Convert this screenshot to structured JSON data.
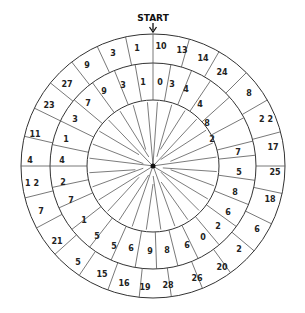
{
  "title": "START",
  "geometry": {
    "cx": 153,
    "cy": 166,
    "r_outer": 132,
    "r_mid": 103,
    "r_inner": 66
  },
  "outer_ring": {
    "labels": [
      {
        "t": "10",
        "x": 161,
        "y": 46
      },
      {
        "t": "13",
        "x": 182,
        "y": 50
      },
      {
        "t": "14",
        "x": 203,
        "y": 58
      },
      {
        "t": "24",
        "x": 222,
        "y": 72
      },
      {
        "t": "8",
        "x": 249,
        "y": 93
      },
      {
        "t": "2 2",
        "x": 266,
        "y": 119
      },
      {
        "t": "17",
        "x": 273,
        "y": 147
      },
      {
        "t": "25",
        "x": 275,
        "y": 172
      },
      {
        "t": "18",
        "x": 270,
        "y": 199
      },
      {
        "t": "6",
        "x": 257,
        "y": 229
      },
      {
        "t": "2",
        "x": 239,
        "y": 249
      },
      {
        "t": "20",
        "x": 222,
        "y": 267
      },
      {
        "t": "26",
        "x": 197,
        "y": 278
      },
      {
        "t": "28",
        "x": 168,
        "y": 285
      },
      {
        "t": "19",
        "x": 145,
        "y": 287
      },
      {
        "t": "16",
        "x": 124,
        "y": 283
      },
      {
        "t": "15",
        "x": 102,
        "y": 274
      },
      {
        "t": "5",
        "x": 78,
        "y": 262
      },
      {
        "t": "21",
        "x": 57,
        "y": 241
      },
      {
        "t": "7",
        "x": 41,
        "y": 211
      },
      {
        "t": "1 2",
        "x": 32,
        "y": 183
      },
      {
        "t": "4",
        "x": 30,
        "y": 160
      },
      {
        "t": "11",
        "x": 35,
        "y": 134
      },
      {
        "t": "23",
        "x": 49,
        "y": 105
      },
      {
        "t": "27",
        "x": 67,
        "y": 84
      },
      {
        "t": "9",
        "x": 87,
        "y": 65
      },
      {
        "t": "3",
        "x": 113,
        "y": 53
      },
      {
        "t": "1",
        "x": 137,
        "y": 48
      }
    ],
    "divider_angles": [
      0,
      16,
      30,
      45,
      60,
      75,
      90,
      102,
      116,
      130,
      144,
      158,
      172,
      186,
      200,
      214,
      228,
      242,
      256,
      270,
      283,
      296,
      309,
      322,
      335,
      348
    ]
  },
  "middle_ring": {
    "labels": [
      {
        "t": "0",
        "x": 160,
        "y": 82
      },
      {
        "t": "3",
        "x": 172,
        "y": 84
      },
      {
        "t": "4",
        "x": 186,
        "y": 89
      },
      {
        "t": "4",
        "x": 200,
        "y": 104
      },
      {
        "t": "8",
        "x": 207,
        "y": 123
      },
      {
        "t": "2",
        "x": 212,
        "y": 139
      },
      {
        "t": "7",
        "x": 238,
        "y": 152
      },
      {
        "t": "5",
        "x": 239,
        "y": 172
      },
      {
        "t": "8",
        "x": 235,
        "y": 192
      },
      {
        "t": "6",
        "x": 228,
        "y": 212
      },
      {
        "t": "2",
        "x": 218,
        "y": 226
      },
      {
        "t": "0",
        "x": 203,
        "y": 237
      },
      {
        "t": "6",
        "x": 187,
        "y": 245
      },
      {
        "t": "8",
        "x": 167,
        "y": 250
      },
      {
        "t": "9",
        "x": 150,
        "y": 251
      },
      {
        "t": "6",
        "x": 131,
        "y": 248
      },
      {
        "t": "5",
        "x": 114,
        "y": 246
      },
      {
        "t": "5",
        "x": 97,
        "y": 236
      },
      {
        "t": "1",
        "x": 84,
        "y": 220
      },
      {
        "t": "7",
        "x": 71,
        "y": 200
      },
      {
        "t": "2",
        "x": 63,
        "y": 182
      },
      {
        "t": "4",
        "x": 62,
        "y": 160
      },
      {
        "t": "1",
        "x": 66,
        "y": 139
      },
      {
        "t": "3",
        "x": 75,
        "y": 119
      },
      {
        "t": "7",
        "x": 88,
        "y": 103
      },
      {
        "t": "9",
        "x": 104,
        "y": 91
      },
      {
        "t": "3",
        "x": 123,
        "y": 85
      },
      {
        "t": "1",
        "x": 143,
        "y": 82
      }
    ],
    "divider_angles": [
      0,
      10,
      22,
      34,
      48,
      62,
      76,
      84,
      98,
      112,
      126,
      140,
      154,
      166,
      178,
      190,
      204,
      218,
      232,
      246,
      258,
      270,
      282,
      296,
      310,
      324,
      338,
      350
    ]
  },
  "spokes": {
    "count": 28,
    "start_angles": [
      4,
      17,
      30,
      43,
      56,
      69,
      82,
      95,
      108,
      121,
      134,
      147,
      160,
      173,
      186,
      199,
      212,
      225,
      238,
      251,
      264,
      277,
      290,
      303,
      316,
      329,
      342,
      355
    ]
  }
}
